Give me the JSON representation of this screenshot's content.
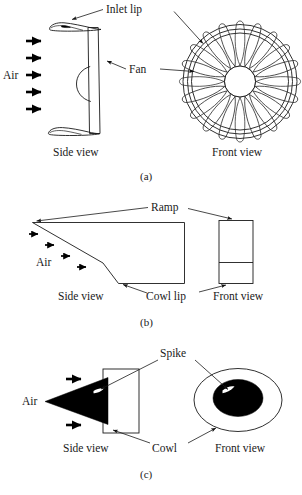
{
  "figure": {
    "panels": [
      {
        "id": "a",
        "caption": "(a)",
        "flow_label": "Air",
        "side_view_label": "Side view",
        "front_view_label": "Front view",
        "callouts": [
          {
            "name": "inlet-lip",
            "text": "Inlet lip"
          },
          {
            "name": "fan",
            "text": "Fan"
          }
        ],
        "arrow_count": 5,
        "fan_blade_count": 20
      },
      {
        "id": "b",
        "caption": "(b)",
        "flow_label": "Air",
        "side_view_label": "Side view",
        "front_view_label": "Front view",
        "callouts": [
          {
            "name": "ramp",
            "text": "Ramp"
          },
          {
            "name": "cowl-lip",
            "text": "Cowl lip"
          }
        ],
        "arrow_count": 4
      },
      {
        "id": "c",
        "caption": "(c)",
        "flow_label": "Air",
        "side_view_label": "Side view",
        "front_view_label": "Front view",
        "callouts": [
          {
            "name": "spike",
            "text": "Spike"
          },
          {
            "name": "cowl",
            "text": "Cowl"
          }
        ],
        "arrow_count": 2
      }
    ],
    "colors": {
      "line": "#1a1a1a",
      "fill_solid": "#000000",
      "background": "#ffffff"
    }
  }
}
